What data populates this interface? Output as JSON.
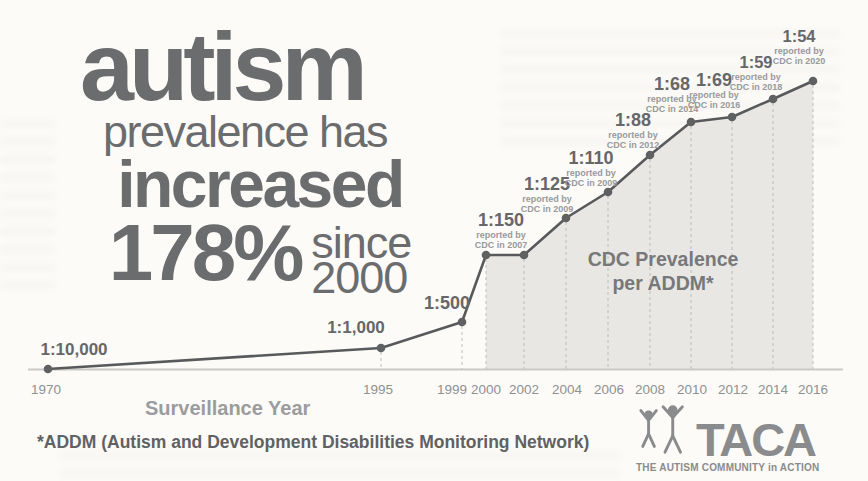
{
  "colors": {
    "headline_gray": "#6b6c6e",
    "line_gray": "#58595b",
    "dot_gray": "#5f6062",
    "note_gray": "#98999b",
    "area_fill": "#e8e7e4",
    "dash_gray": "#bcbcb9",
    "axis_gray": "#c9c9c6",
    "logo_gray": "#8a8b8d"
  },
  "headline": {
    "word_autism": "autism",
    "line_prevalence": "prevalence has",
    "word_increased": "increased",
    "percent": "178%",
    "since_word": "since",
    "since_year": "2000"
  },
  "chart_data": {
    "type": "line",
    "title": "autism prevalence has increased 178% since 2000",
    "xlabel": "Surveillance Year",
    "area_label_line1": "CDC Prevalence",
    "area_label_line2": "per ADDM*",
    "x_ticks": [
      "1970",
      "1995",
      "1999",
      "2000",
      "2002",
      "2004",
      "2006",
      "2008",
      "2010",
      "2012",
      "2014",
      "2016"
    ],
    "points": [
      {
        "year": "1970",
        "ratio": "1:10,000",
        "value": 10000
      },
      {
        "year": "1995",
        "ratio": "1:1,000",
        "value": 1000
      },
      {
        "year": "1999",
        "ratio": "1:500",
        "value": 500
      },
      {
        "year": "2000",
        "ratio": "1:150",
        "value": 150,
        "note_line1": "reported by",
        "note_line2": "CDC in 2007"
      },
      {
        "year": "2002",
        "ratio": "1:150",
        "value": 150,
        "label_shown": false
      },
      {
        "year": "2004",
        "ratio": "1:125",
        "value": 125,
        "note_line1": "reported by",
        "note_line2": "CDC in 2009"
      },
      {
        "year": "2006",
        "ratio": "1:110",
        "value": 110,
        "note_line1": "reported by",
        "note_line2": "CDC in 2009"
      },
      {
        "year": "2008",
        "ratio": "1:88",
        "value": 88,
        "note_line1": "reported by",
        "note_line2": "CDC in 2012"
      },
      {
        "year": "2010",
        "ratio": "1:68",
        "value": 68,
        "note_line1": "reported by",
        "note_line2": "CDC in 2014"
      },
      {
        "year": "2012",
        "ratio": "1:69",
        "value": 69,
        "note_line1": "reported by",
        "note_line2": "CDC in 2016"
      },
      {
        "year": "2014",
        "ratio": "1:59",
        "value": 59,
        "note_line1": "reported by",
        "note_line2": "CDC in 2018"
      },
      {
        "year": "2016",
        "ratio": "1:54",
        "value": 54,
        "note_line1": "reported by",
        "note_line2": "CDC in 2020"
      }
    ]
  },
  "footnote": "*ADDM (Autism and Development Disabilities Monitoring Network)",
  "logo": {
    "name": "TACA",
    "tagline": "THE AUTISM COMMUNITY in ACTION"
  }
}
